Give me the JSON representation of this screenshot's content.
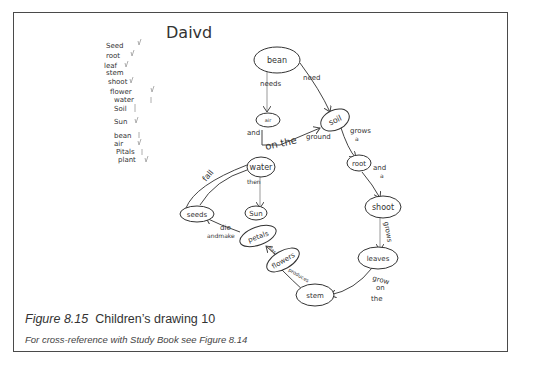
{
  "figure": {
    "author_name": "David",
    "author_name_as_written": "Daivd",
    "word_list": [
      "Seed",
      "root",
      "leaf",
      "stem",
      "shoot",
      "flower",
      "water",
      "Soil",
      "Sun",
      "bean",
      "air",
      "Pitals",
      "plant"
    ],
    "nodes": [
      {
        "id": "bean",
        "label": "bean"
      },
      {
        "id": "air",
        "label": "air"
      },
      {
        "id": "soil",
        "label": "soil"
      },
      {
        "id": "water",
        "label": "water"
      },
      {
        "id": "sun",
        "label": "Sun"
      },
      {
        "id": "root",
        "label": "root"
      },
      {
        "id": "shoot",
        "label": "shoot"
      },
      {
        "id": "leaves",
        "label": "leaves"
      },
      {
        "id": "stem",
        "label": "stem"
      },
      {
        "id": "flowers",
        "label": "flowers"
      },
      {
        "id": "petals",
        "label": "petals"
      },
      {
        "id": "seeds",
        "label": "seeds"
      }
    ],
    "links": [
      {
        "from": "bean",
        "to": "air",
        "label": "needs"
      },
      {
        "from": "bean",
        "to": "soil",
        "label": "need"
      },
      {
        "from": "air",
        "to": "soil",
        "label": "and on the ground"
      },
      {
        "from": "water",
        "to": "sun",
        "label": "then"
      },
      {
        "from": "soil",
        "to": "root",
        "label": "grows a"
      },
      {
        "from": "root",
        "to": "shoot",
        "label": "and a"
      },
      {
        "from": "shoot",
        "to": "leaves",
        "label": "grows"
      },
      {
        "from": "leaves",
        "to": "stem",
        "label": "grow on the"
      },
      {
        "from": "stem",
        "to": "flowers",
        "label": "produces"
      },
      {
        "from": "flowers",
        "to": "petals",
        "label": "has"
      },
      {
        "from": "petals",
        "to": "seeds",
        "label": "die and make"
      },
      {
        "from": "seeds",
        "to": "soil",
        "label": "fall"
      }
    ],
    "labels": {
      "needs": "needs",
      "need": "need",
      "and": "and",
      "on_the": "on the",
      "ground": "ground",
      "grows_a_1": "grows",
      "grows_a_2": "a",
      "and_a_1": "and",
      "and_a_2": "a",
      "grows_vert": "grows",
      "grow": "grow",
      "on": "on",
      "the": "the",
      "produces": "produces",
      "has": "has",
      "die": "die",
      "andmake": "andmake",
      "then": "then",
      "fall": "fall"
    }
  },
  "caption": {
    "figure_number": "Figure 8.15",
    "title": "Children’s drawing 10",
    "cross_reference": "For cross-reference with Study Book see Figure 8.14"
  }
}
